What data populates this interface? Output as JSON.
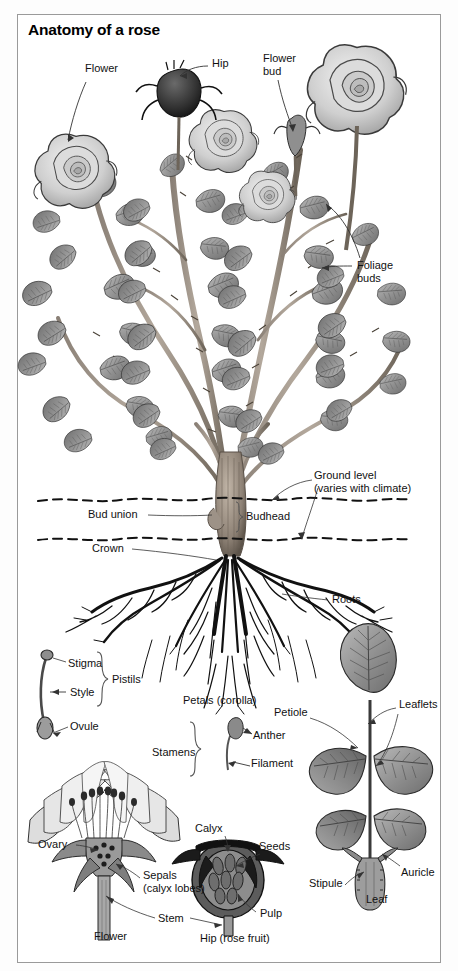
{
  "figure": {
    "title": "Anatomy of a rose",
    "type": "botanical-diagram",
    "frame_border_color": "#9a9a9a",
    "page_background": "#fdfdfd",
    "art_style": "grayscale line illustration"
  },
  "labels": {
    "plant_overview": [
      {
        "id": "flower",
        "text": "Flower",
        "x": 85,
        "y": 68
      },
      {
        "id": "hip",
        "text": "Hip",
        "x": 212,
        "y": 63
      },
      {
        "id": "flower_bud",
        "text": "Flower\nbud",
        "x": 263,
        "y": 57
      },
      {
        "id": "foliage_buds",
        "text": "Foliage\nbuds",
        "x": 355,
        "y": 263
      }
    ],
    "root_zone": [
      {
        "id": "ground_level",
        "text": "Ground level\n(varies with climate)",
        "x": 314,
        "y": 475
      },
      {
        "id": "bud_union",
        "text": "Bud union",
        "x": 88,
        "y": 513
      },
      {
        "id": "budhead",
        "text": "Budhead",
        "x": 242,
        "y": 515
      },
      {
        "id": "crown",
        "text": "Crown",
        "x": 92,
        "y": 546
      },
      {
        "id": "roots",
        "text": "Roots",
        "x": 330,
        "y": 597
      }
    ],
    "pistil_detail": [
      {
        "id": "stigma",
        "text": "Stigma",
        "x": 68,
        "y": 663
      },
      {
        "id": "style",
        "text": "Style",
        "x": 70,
        "y": 692
      },
      {
        "id": "ovule",
        "text": "Ovule",
        "x": 70,
        "y": 726
      },
      {
        "id": "pistils",
        "text": "Pistils",
        "x": 116,
        "y": 679
      }
    ],
    "stamen_detail": [
      {
        "id": "petals_corolla",
        "text": "Petals (corolla)",
        "x": 183,
        "y": 700
      },
      {
        "id": "stamens",
        "text": "Stamens",
        "x": 158,
        "y": 752
      },
      {
        "id": "anther",
        "text": "Anther",
        "x": 247,
        "y": 735
      },
      {
        "id": "filament",
        "text": "Filament",
        "x": 245,
        "y": 763
      }
    ],
    "flower_section": [
      {
        "id": "ovary",
        "text": "Ovary",
        "x": 40,
        "y": 844
      },
      {
        "id": "sepals",
        "text": "Sepals\n(calyx lobes)",
        "x": 143,
        "y": 875
      },
      {
        "id": "stem",
        "text": "Stem",
        "x": 158,
        "y": 918
      },
      {
        "id": "flower_caption",
        "text": "Flower",
        "x": 97,
        "y": 936
      }
    ],
    "hip_section": [
      {
        "id": "calyx",
        "text": "Calyx",
        "x": 197,
        "y": 828
      },
      {
        "id": "seeds",
        "text": "Seeds",
        "x": 258,
        "y": 846
      },
      {
        "id": "pulp",
        "text": "Pulp",
        "x": 260,
        "y": 913
      },
      {
        "id": "hip_caption",
        "text": "Hip (rose fruit)",
        "x": 204,
        "y": 938
      }
    ],
    "leaf_detail": [
      {
        "id": "leaflets",
        "text": "Leaflets",
        "x": 399,
        "y": 704
      },
      {
        "id": "petiole",
        "text": "Petiole",
        "x": 276,
        "y": 712
      },
      {
        "id": "stipule",
        "text": "Stipule",
        "x": 313,
        "y": 883
      },
      {
        "id": "auricle",
        "text": "Auricle",
        "x": 401,
        "y": 872
      },
      {
        "id": "leaf_caption",
        "text": "Leaf",
        "x": 370,
        "y": 899
      }
    ]
  }
}
